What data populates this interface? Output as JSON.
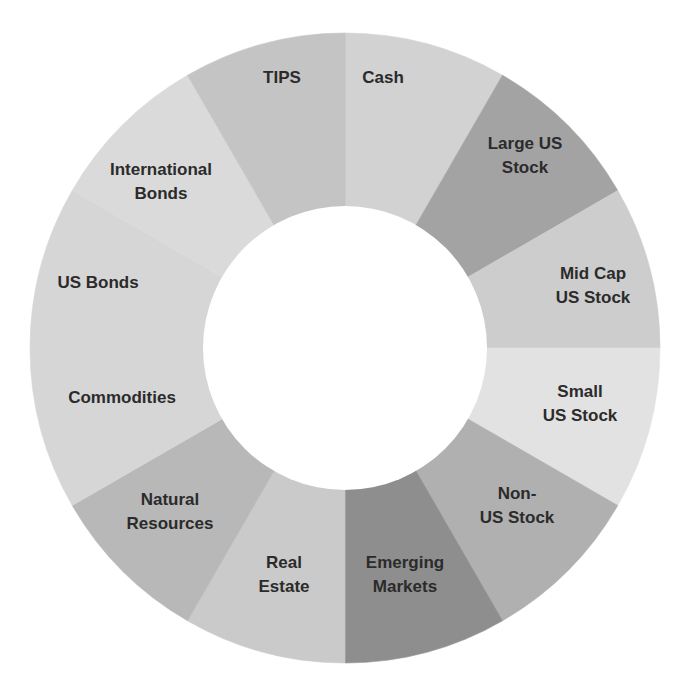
{
  "chart_data": {
    "type": "pie",
    "variant": "donut",
    "title": "",
    "center": [
      345,
      348
    ],
    "outer_radius": 315,
    "inner_radius": 142,
    "start_angle_deg": 0,
    "direction": "clockwise",
    "legend": "none (labels inside segments)",
    "categories": [
      "Cash",
      "Large US Stock",
      "Mid Cap US Stock",
      "Small US Stock",
      "Non-US Stock",
      "Emerging Markets",
      "Real Estate",
      "Natural Resources",
      "Commodities",
      "US Bonds",
      "International Bonds",
      "TIPS"
    ],
    "values": [
      1,
      1,
      1,
      1,
      1,
      1,
      1,
      1,
      1,
      1,
      1,
      1
    ],
    "segments": [
      {
        "name": "Cash",
        "lines": [
          "Cash"
        ],
        "value": 1,
        "color": "#d2d2d2",
        "label_pos": [
          383,
          77
        ]
      },
      {
        "name": "Large US Stock",
        "lines": [
          "Large US",
          "Stock"
        ],
        "value": 1,
        "color": "#a3a3a3",
        "label_pos": [
          525,
          155
        ]
      },
      {
        "name": "Mid Cap US Stock",
        "lines": [
          "Mid Cap",
          "US Stock"
        ],
        "value": 1,
        "color": "#cdcdcd",
        "label_pos": [
          593,
          285
        ]
      },
      {
        "name": "Small US Stock",
        "lines": [
          "Small",
          "US Stock"
        ],
        "value": 1,
        "color": "#e2e2e2",
        "label_pos": [
          580,
          403
        ]
      },
      {
        "name": "Non-US Stock",
        "lines": [
          "Non-",
          "US Stock"
        ],
        "value": 1,
        "color": "#b0b0b0",
        "label_pos": [
          517,
          505
        ]
      },
      {
        "name": "Emerging Markets",
        "lines": [
          "Emerging",
          "Markets"
        ],
        "value": 1,
        "color": "#8e8e8e",
        "label_pos": [
          405,
          574
        ]
      },
      {
        "name": "Real Estate",
        "lines": [
          "Real",
          "Estate"
        ],
        "value": 1,
        "color": "#cacaca",
        "label_pos": [
          284,
          574
        ]
      },
      {
        "name": "Natural Resources",
        "lines": [
          "Natural",
          "Resources"
        ],
        "value": 1,
        "color": "#b8b8b8",
        "label_pos": [
          170,
          511
        ]
      },
      {
        "name": "Commodities",
        "lines": [
          "Commodities"
        ],
        "value": 1,
        "color": "#d6d6d6",
        "label_pos": [
          122,
          397
        ]
      },
      {
        "name": "US Bonds",
        "lines": [
          "US Bonds"
        ],
        "value": 1,
        "color": "#d6d6d6",
        "label_pos": [
          98,
          282
        ]
      },
      {
        "name": "International Bonds",
        "lines": [
          "International",
          "Bonds"
        ],
        "value": 1,
        "color": "#dadada",
        "label_pos": [
          161,
          181
        ]
      },
      {
        "name": "TIPS",
        "lines": [
          "TIPS"
        ],
        "value": 1,
        "color": "#c4c4c4",
        "label_pos": [
          282,
          77
        ]
      }
    ]
  }
}
